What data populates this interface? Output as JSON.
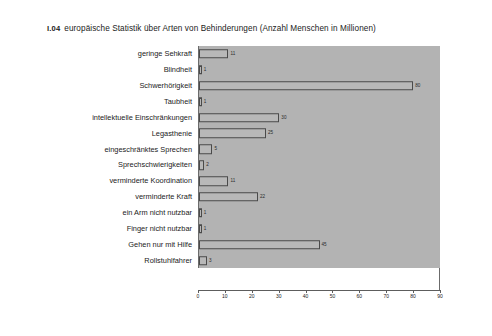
{
  "caption": {
    "figure_number": "I.04",
    "text": "europäische Statistik über Arten von Behinderungen (Anzahl Menschen in Millionen)"
  },
  "chart_data": {
    "type": "bar",
    "orientation": "horizontal",
    "title": "europäische Statistik über Arten von Behinderungen (Anzahl Menschen in Millionen)",
    "xlabel": "",
    "ylabel": "",
    "xlim": [
      0,
      90
    ],
    "xticks": [
      0,
      10,
      20,
      30,
      40,
      50,
      60,
      70,
      80,
      90
    ],
    "xtick_labels": [
      "0",
      "10",
      "20",
      "30",
      "40",
      "50",
      "60",
      "70",
      "80",
      "90"
    ],
    "grid": false,
    "legend": null,
    "categories": [
      "geringe Sehkraft",
      "Blindheit",
      "Schwerhörigkeit",
      "Taubheit",
      "intellektuelle Einschränkungen",
      "Legasthenie",
      "eingeschränktes Sprechen",
      "Sprechschwierigkeiten",
      "verminderte Koordination",
      "verminderte Kraft",
      "ein Arm nicht nutzbar",
      "Finger nicht nutzbar",
      "Gehen nur mit Hilfe",
      "Rollstuhlfahrer"
    ],
    "values": [
      11,
      1,
      80,
      1,
      30,
      25,
      5,
      2,
      11,
      22,
      1,
      1,
      45,
      3
    ],
    "value_labels": [
      "11",
      "1",
      "80",
      "1",
      "30",
      "25",
      "5",
      "2",
      "11",
      "22",
      "1",
      "1",
      "45",
      "3"
    ],
    "colors": {
      "panel_background": "#b3b3b3",
      "bar_fill": "#b8b8b8",
      "bar_border": "#4a4a4a",
      "axis": "#5d5d5d",
      "text": "#1a1a1a",
      "page_background": "#ffffff"
    }
  }
}
